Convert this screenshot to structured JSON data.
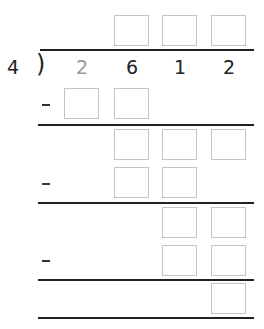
{
  "problem": {
    "divisor": "4",
    "dividend_digits": [
      {
        "value": "2",
        "color": "#999999"
      },
      {
        "value": "6",
        "color": "#222222"
      },
      {
        "value": "1",
        "color": "#222222"
      },
      {
        "value": "2",
        "color": "#222222"
      }
    ],
    "bracket": ")",
    "quotient_boxes": 3,
    "steps": [
      {
        "operator": "-",
        "subtract_boxes": 2,
        "remainder_boxes": 3
      },
      {
        "operator": "-",
        "subtract_boxes": 2,
        "remainder_boxes": 2
      },
      {
        "operator": "-",
        "subtract_boxes": 2,
        "remainder_boxes": 1
      }
    ]
  },
  "colors": {
    "box_border": "#c4c4c4",
    "line": "#222222",
    "faded_digit": "#999999"
  }
}
